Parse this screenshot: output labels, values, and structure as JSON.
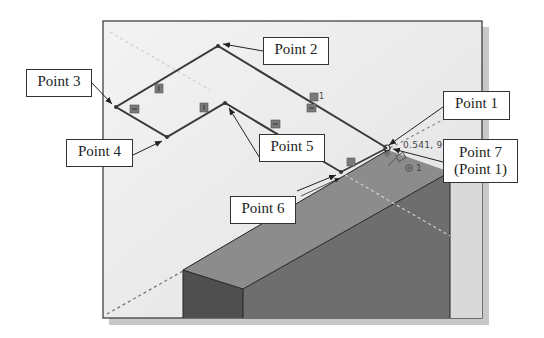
{
  "figure": {
    "colors": {
      "frame_border": "#333333",
      "viewport_bg": "#ececec",
      "shadow": "#c8c8c8",
      "sketch_line": "#3a3a3a",
      "block_top": "#8c8c8c",
      "block_front": "#6e6e6e",
      "block_side": "#4f4f4f",
      "relation_glyph": "#7a7a7a"
    }
  },
  "callouts": [
    {
      "id": "point-1",
      "label": "Point 1"
    },
    {
      "id": "point-2",
      "label": "Point 2"
    },
    {
      "id": "point-3",
      "label": "Point 3"
    },
    {
      "id": "point-4",
      "label": "Point 4"
    },
    {
      "id": "point-5",
      "label": "Point 5"
    },
    {
      "id": "point-6",
      "label": "Point 6"
    },
    {
      "id": "point-7",
      "label_line1": "Point 7",
      "label_line2": "(Point 1)"
    }
  ],
  "cursor_readout": {
    "text": "0.541, 9"
  },
  "relation_badge": {
    "text": "1"
  },
  "relation_badge_2": {
    "text": "1"
  }
}
